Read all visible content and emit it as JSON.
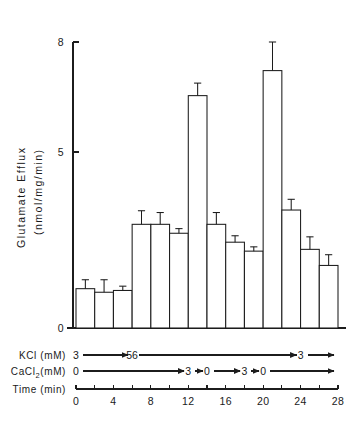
{
  "chart_data": {
    "type": "bar",
    "title": "",
    "xlabel": "Time (min)",
    "ylabel": "Glutamate Efflux (nmol/mg/min)",
    "ylabel_line1": "Glutamate  Efflux",
    "ylabel_line2": "(nmol/mg/min)",
    "ylim": [
      0,
      8
    ],
    "yticks": [
      0,
      5,
      8
    ],
    "ytick_labels": [
      "0",
      "5",
      "8"
    ],
    "grid": false,
    "legend": "none",
    "bin_width_min": 2,
    "x_start_min": 0,
    "x_end_min": 28,
    "xticks": [
      0,
      2,
      4,
      6,
      8,
      10,
      12,
      14,
      16,
      18,
      20,
      22,
      24,
      26,
      28
    ],
    "xtick_labels": [
      "0",
      "",
      "4",
      "",
      "8",
      "",
      "12",
      "",
      "16",
      "",
      "20",
      "",
      "24",
      "",
      "28"
    ],
    "xtick_labels_shown": [
      "0",
      "4",
      "8",
      "12",
      "16",
      "20",
      "24",
      "28"
    ],
    "categories": [
      "0-2",
      "2-4",
      "4-6",
      "6-8",
      "8-10",
      "10-12",
      "12-14",
      "14-16",
      "16-18",
      "18-20",
      "20-22",
      "22-24",
      "24-26",
      "26-28"
    ],
    "values": [
      1.1,
      1.0,
      1.05,
      2.9,
      2.9,
      2.65,
      6.5,
      2.9,
      2.4,
      2.15,
      7.2,
      3.3,
      2.2,
      1.75
    ],
    "errors": [
      0.25,
      0.35,
      0.12,
      0.38,
      0.33,
      0.13,
      0.35,
      0.33,
      0.18,
      0.12,
      0.8,
      0.3,
      0.35,
      0.3
    ],
    "error_type": "SEM",
    "series": [
      {
        "name": "Glutamate Efflux",
        "values": [
          1.1,
          1.0,
          1.05,
          2.9,
          2.9,
          2.65,
          6.5,
          2.9,
          2.4,
          2.15,
          7.2,
          3.3,
          2.2,
          1.75
        ]
      }
    ]
  },
  "annotations": {
    "kcl": {
      "label": "KCl (mM)",
      "segments": [
        {
          "value": "3",
          "from_min": 0,
          "to_min": 6
        },
        {
          "value": "56",
          "from_min": 6,
          "to_min": 24
        },
        {
          "value": "3",
          "from_min": 24,
          "to_min": 28
        }
      ]
    },
    "cacl2": {
      "label_main": "CaCl",
      "label_sub": "2",
      "label_tail": "(mM)",
      "label": "CaCl2 (mM)",
      "segments": [
        {
          "value": "0",
          "from_min": 0,
          "to_min": 12
        },
        {
          "value": "3",
          "from_min": 12,
          "to_min": 14
        },
        {
          "value": "0",
          "from_min": 14,
          "to_min": 18
        },
        {
          "value": "3",
          "from_min": 18,
          "to_min": 20
        },
        {
          "value": "0",
          "from_min": 20,
          "to_min": 28
        }
      ]
    },
    "time": {
      "label": "Time (min)"
    }
  },
  "colors": {
    "ink": "#1c1c1c",
    "bar_fill": "#ffffff",
    "background": "#ffffff"
  }
}
